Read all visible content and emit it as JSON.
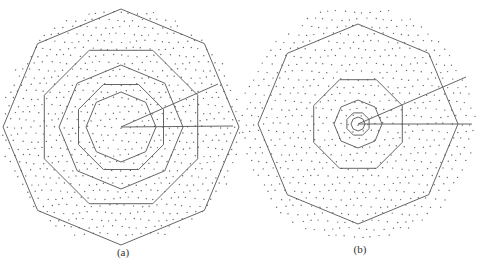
{
  "figure": {
    "panels": [
      {
        "id": "a",
        "label": "(a)",
        "center": [
          121,
          127
        ],
        "octagon_radii": [
          118,
          83,
          62,
          46,
          35
        ],
        "rotation_deg": 22.5,
        "dot_spacing": 8.2,
        "dot_extent": 120,
        "rays": [
          [
            121,
            127,
            233,
            126
          ],
          [
            121,
            127,
            218,
            84
          ]
        ],
        "label_pos": [
          123,
          259
        ]
      },
      {
        "id": "b",
        "label": "(b)",
        "center": [
          358,
          124
        ],
        "octagon_radii": [
          100,
          48,
          24,
          12,
          7
        ],
        "rotation_deg": 22.5,
        "dot_spacing": 8.6,
        "dot_extent": 118,
        "rays": [
          [
            358,
            124,
            472,
            124
          ],
          [
            358,
            124,
            466,
            77
          ]
        ],
        "label_pos": [
          360,
          256
        ]
      }
    ],
    "colors": {
      "line": "#555555",
      "dot": "#666666",
      "background": "#ffffff"
    }
  }
}
